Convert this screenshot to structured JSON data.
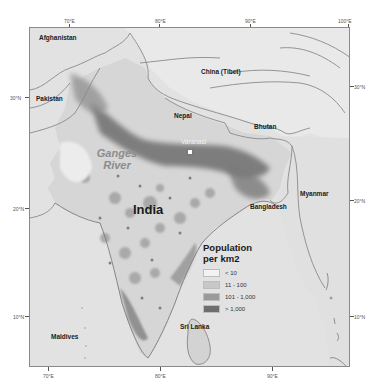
{
  "map": {
    "title": "Population density of India and the Ganges basin",
    "labels": {
      "afghanistan": "Afghanistan",
      "pakistan": "Pakistan",
      "china": "China (Tibet)",
      "nepal": "Nepal",
      "bhutan": "Bhutan",
      "bangladesh": "Bangladesh",
      "myanmar": "Myanmar",
      "india": "India",
      "sri_lanka": "Sri Lanka",
      "maldives": "Maldives",
      "river_line1": "Ganges",
      "river_line2": "River",
      "city": "Varanasi"
    },
    "axes": {
      "top": [
        "70°E",
        "80°E",
        "90°E",
        "100°E"
      ],
      "bottom": [
        "70°E",
        "80°E",
        "90°E"
      ],
      "left": [
        "30°N",
        "20°N",
        "10°N"
      ],
      "right": [
        "30°N",
        "20°N",
        "10°N"
      ]
    }
  },
  "legend": {
    "title_line1": "Population",
    "title_line2": "per km2",
    "items": [
      {
        "label": "< 10",
        "color": "#f3f3f3"
      },
      {
        "label": "11 - 100",
        "color": "#c8c8c8"
      },
      {
        "label": "101 - 1,000",
        "color": "#9a9a9a"
      },
      {
        "label": "> 1,000",
        "color": "#6e6e6e"
      }
    ]
  },
  "colors": {
    "background": "#e4e4e4",
    "frame": "#8a8a8a",
    "border_lines": "#8a8a8a"
  }
}
